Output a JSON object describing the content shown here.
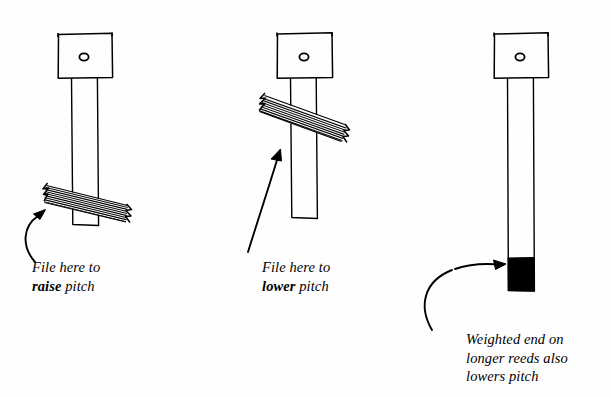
{
  "page": {
    "background_color": "#fefefe",
    "ink_color": "#000000",
    "width": 611,
    "height": 397
  },
  "diagram": {
    "type": "hand-drawn-line-illustration",
    "figures": [
      {
        "id": "reed-raise",
        "name": "reed-left",
        "plate": {
          "x": 58,
          "y": 33,
          "width": 54,
          "height": 45
        },
        "plate_hole": {
          "cx": 84,
          "cy": 57,
          "r": 4
        },
        "tongue": {
          "x": 71,
          "y": 78,
          "width": 27,
          "height": 147
        },
        "file_band": {
          "position": "near-free-tip",
          "angle_deg": 13,
          "lines": 9
        },
        "weight": null
      },
      {
        "id": "reed-lower",
        "name": "reed-middle",
        "plate": {
          "x": 277,
          "y": 33,
          "width": 55,
          "height": 45
        },
        "plate_hole": {
          "cx": 304,
          "cy": 57,
          "r": 4
        },
        "tongue": {
          "x": 290,
          "y": 78,
          "width": 27,
          "height": 140
        },
        "file_band": {
          "position": "near-base",
          "angle_deg": 13,
          "lines": 9
        },
        "weight": null
      },
      {
        "id": "reed-weighted",
        "name": "reed-right",
        "plate": {
          "x": 494,
          "y": 33,
          "width": 54,
          "height": 45
        },
        "plate_hole": {
          "cx": 520,
          "cy": 57,
          "r": 4
        },
        "tongue": {
          "x": 507,
          "y": 78,
          "width": 27,
          "height": 213
        },
        "file_band": null,
        "weight": {
          "x": 507,
          "y": 258,
          "width": 27,
          "height": 33,
          "fill": "#000000"
        }
      }
    ],
    "arrows": [
      {
        "id": "arrow-raise",
        "name": "curved-arrow-to-file-band-left",
        "style": "curved",
        "points_to": "reed-raise.file_band"
      },
      {
        "id": "arrow-lower",
        "name": "straight-arrow-to-file-band-middle",
        "style": "straight",
        "points_to": "reed-lower.file_band"
      },
      {
        "id": "arrow-weight",
        "name": "curved-arrow-to-weight-right",
        "style": "curved",
        "points_to": "reed-weighted.weight"
      }
    ]
  },
  "captions": {
    "raise": {
      "line1": "File here to",
      "emphasis": "raise",
      "line2_rest": " pitch"
    },
    "lower": {
      "line1": "File here to",
      "emphasis": "lower",
      "line2_rest": " pitch"
    },
    "weighted": {
      "line1": "Weighted end on",
      "line2": "longer reeds also",
      "line3": "lowers pitch"
    }
  }
}
